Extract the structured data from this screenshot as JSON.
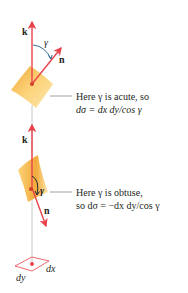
{
  "colors": {
    "vector": "#e8434b",
    "surface_light": "#fcd37a",
    "surface_dark": "#f2a93a",
    "leader_line": "#8a8a8a",
    "angle_arc": "#1e5b8f",
    "text": "#231f20"
  },
  "upper": {
    "k_label": "k",
    "n_label": "n",
    "gamma_label": "γ",
    "caption_line1": "Here γ is acute, so",
    "caption_line2": "dσ = dx dy/cos γ"
  },
  "lower": {
    "k_label": "k",
    "n_label": "n",
    "gamma_label": "γ",
    "caption_line1": "Here γ is obtuse,",
    "caption_line2": "so dσ = −dx dy/cos γ"
  },
  "base": {
    "dx_label": "dx",
    "dy_label": "dy"
  }
}
